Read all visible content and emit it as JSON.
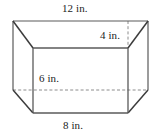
{
  "figure": {
    "kind": "rectangular-prism-diagram",
    "background_color": "#ffffff",
    "solid_line_color": "#5a5a5a",
    "dark_edge_color": "#3c3c3c",
    "dashed_line_color": "#8c8c8c",
    "face_fill": "#ffffff",
    "labels": {
      "top": "12 in.",
      "depth": "4 in.",
      "height": "6 in.",
      "bottom": "8 in."
    },
    "geometry": {
      "outer_top_left": [
        13,
        21
      ],
      "outer_top_right": [
        148,
        21
      ],
      "outer_left_mid": [
        13,
        90
      ],
      "outer_right_mid": [
        148,
        90
      ],
      "front_top_left": [
        33,
        48
      ],
      "front_top_right": [
        128,
        48
      ],
      "front_bottom_left": [
        33,
        113
      ],
      "front_bottom_right": [
        128,
        113
      ],
      "dashed_horizontal_y": 90,
      "dashed_vertical_x": 128
    }
  }
}
